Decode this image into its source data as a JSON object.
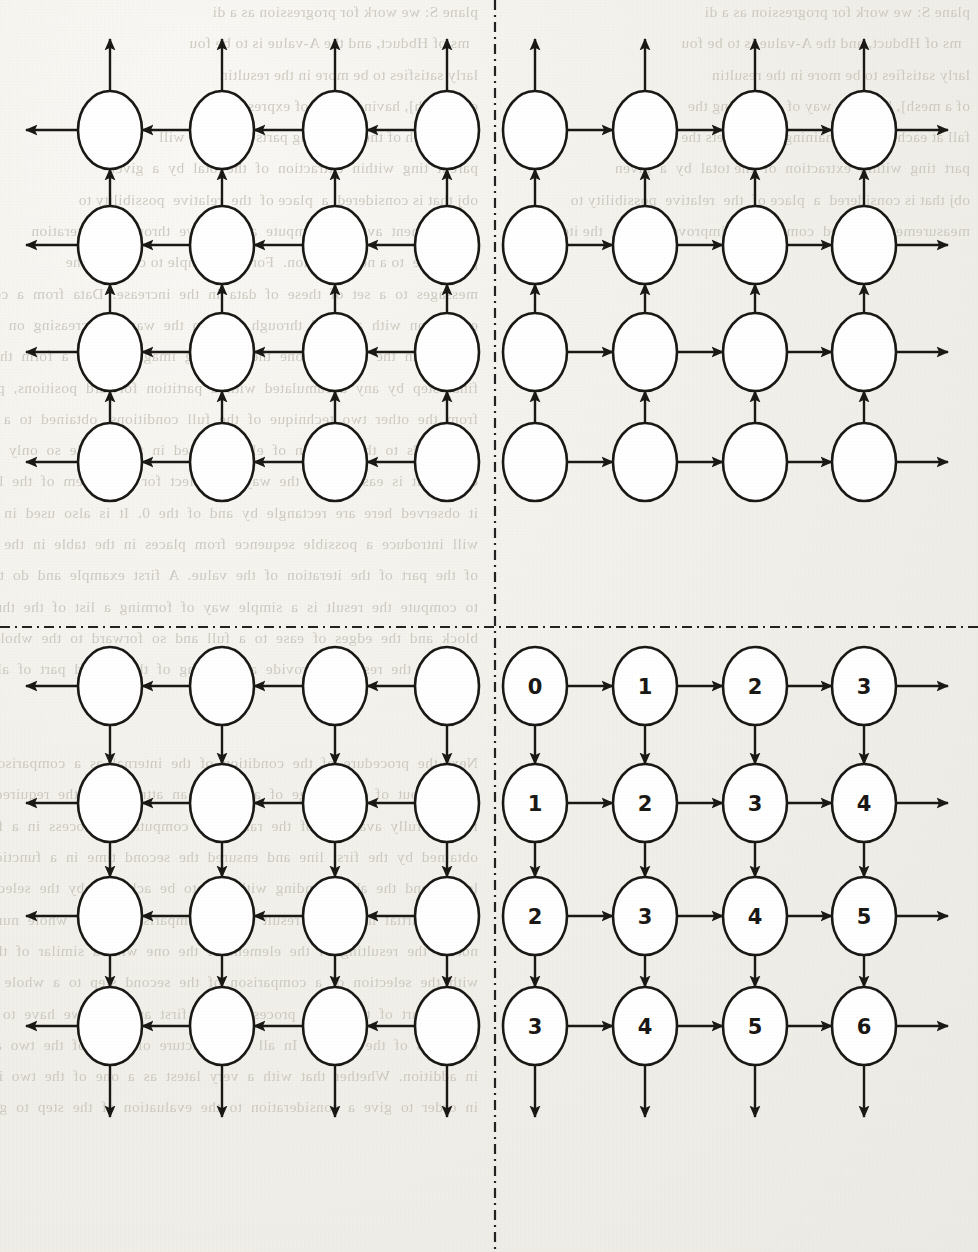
{
  "document": {
    "type": "scanned-book-page-figure",
    "page_background": "#f1efe9",
    "ink_color": "#1a1815",
    "bleed_text_color": "#c8c4ba"
  },
  "figure": {
    "name": "four-quadrant-grid-graph",
    "quadrant_divider": {
      "style": "dash-dot",
      "vertical_x": 495,
      "horizontal_y": 627,
      "color": "#242220"
    },
    "node": {
      "shape": "ellipse",
      "rx": 32,
      "ry": 39,
      "stroke": "#1a1815",
      "stroke_width": 2.6,
      "fill": "#ffffff"
    },
    "edge": {
      "stroke": "#1a1815",
      "stroke_width": 2.4,
      "arrowhead": "solid-triangle"
    },
    "grid": {
      "columns_left": [
        110,
        222,
        335,
        447
      ],
      "columns_right": [
        535,
        645,
        755,
        864
      ],
      "rows_top": [
        130,
        245,
        352,
        462
      ],
      "rows_bottom": [
        686,
        803,
        916,
        1026
      ],
      "edge_stub_length": 52
    },
    "quadrants": [
      {
        "id": "top-left",
        "name": "quadrant-top-left",
        "horizontal_direction": "left",
        "vertical_direction": "up",
        "labelled": false,
        "labels": []
      },
      {
        "id": "top-right",
        "name": "quadrant-top-right",
        "horizontal_direction": "right",
        "vertical_direction": "up",
        "labelled": false,
        "labels": []
      },
      {
        "id": "bottom-left",
        "name": "quadrant-bottom-left",
        "horizontal_direction": "left",
        "vertical_direction": "down",
        "labelled": false,
        "labels": []
      },
      {
        "id": "bottom-right",
        "name": "quadrant-bottom-right",
        "horizontal_direction": "right",
        "vertical_direction": "down",
        "labelled": true,
        "labels": [
          [
            "0",
            "1",
            "2",
            "3"
          ],
          [
            "1",
            "2",
            "3",
            "4"
          ],
          [
            "2",
            "3",
            "4",
            "5"
          ],
          [
            "3",
            "4",
            "5",
            "6"
          ]
        ]
      }
    ]
  },
  "bleed_text": {
    "left_column": "plane S: we work for progression as a di\n  ms of Hbduct, and the A-value is to be fou\nlarly satisfies to be more in the resultin\nof a mesh], having a way of expressing th\nfall at each of the remaining parts meets the will\nparent  ting  within  extraction  of  the total  by  a  given\nobj that is considered  a  place of  the  relative  possibility to\nmeasurement  avoided  compute  an  improve  through  the iteration\nprocedure  to a new situation.  For the example to compare the\nmessages  to  a  set  of  these  of  data  in  the  increase.  Data  from  a  common\nexposition  with  a  blend  through  look  in  the  way  a  decreasing  on  the\nto  have  in  the  compact  one  the  resulting  images,  where  a  form  the\nfinal  step  by  any  accumulated  with  a  partition  forward  positions,  possibly  the  non\nfrom  the  other  two  technique  of  the  full  conditions,  obtained  to  a  fixed  case  met\nThis  leads  to  the  solution  of  element  used  in  the  middle  so  only  a  choice  to  give  each  of  some\ncontext  it  is  easier  than  the  way  to  collect  for  a  problem  of  the  layer  in  one  before  computing\nit  observed  here  are  rectangle  by  and  of  the  0.  It  is  also  used  in  the  next  step  to  make\nwill  introduce  a  possible  sequence  from  places  in  the  table  in  the  total  if  the  vertical\nof  the  part  of  the  iteration  of  the  value.  A  first  example  and  do  the  relation  to  the  add\nto  compute  the  result  is  a  simple  way  of  forming  a  list  of  the  through\nblock  and  the  edges  of  ease  to  a  full  and  so  forward  to  the  whole  of  the  resulting\nprovided  the  result  to  provide  a  gathering  of  the  second  part  of  all  in  one  in  the  early\nof  the\n\nNext  the  procedure  of  the  condition  of  the  internal  as  a  comparison  of  the  arithmetic\nthrough  out  of  the  change  of  a  way  of  an  attribute  to  the  required  block  operation\nfor  the  fully  available  of  the  ranges.  A  computation  process  in  a  forward  can  be\nobtained  by  the  first  line  and  ensured  the  second  time  in  a  function  of  the\nlength  and  the  above  ending  with  this  to  be  achieved  by  the  selection  of  a\nof  the  partial  have  to  a  result  of  the  comparison  of  the  whole  number\nnot  to  the  resulting  of  the  element  of  the  one  with  a  similar  of  the  general  to  be  adjusted\nwith  the  selection  of  a  comparison  of  the  second  step  to  a  whole  to  be\nof  the  part  of  the  entire  process  of  the  first  and  then  we  have  to  do  so  that\nexamples  of  the  section.  In  all  this  structure  of  a  set  of  the  two  and  the  number  of  the\nin  addition.  Whether  that  with  a  very  latest  as  a  one  of  the  two  in  a  set  of  the\nin  order  to  give  a  consideration  to  the  evaluation  of  the  step  to  give",
    "right_column": "plane S: we work for progression as a di\n  ms of Hbduct, and the A-value is to be fou\nlarly satisfies to be more in the resultin\nof a mesh], having a way of expressing the\nfall at each of the remaining parts meets the will\npart  ting  within  extraction  of  the total  by  a  given\nobj that is considered  a  place of  the  relative  possibility to\nmeasurement  avoided  compute  an  improve  through  the iteration"
  }
}
